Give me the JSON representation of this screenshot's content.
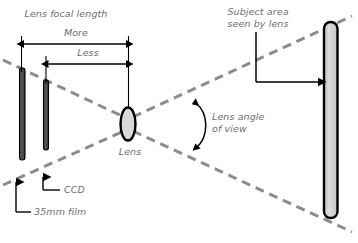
{
  "diagram": {
    "type": "optics-schematic",
    "title": "Lens focal length",
    "background_color": "#ffffff",
    "label_color": "#6d6d6d",
    "ray_color": "#8c8c8c",
    "sensor_fill": "#4a4a4a",
    "subject_fill": "#cfcfcf",
    "lens_fill": "#d9d9d9",
    "outline_color": "#000000"
  },
  "labels": {
    "title": "Lens focal length",
    "more": "More",
    "less": "Less",
    "lens": "Lens",
    "ccd": "CCD",
    "film": "35mm film",
    "subject_area_line1": "Subject area",
    "subject_area_line2": "seen by lens",
    "angle_line1": "Lens angle",
    "angle_line2": "of view"
  },
  "elements": {
    "film_plane": {
      "name": "35mm film",
      "x": 22,
      "top": 68,
      "bottom": 160
    },
    "ccd_plane": {
      "name": "CCD",
      "x": 46,
      "top": 80,
      "bottom": 150
    },
    "lens": {
      "name": "Lens",
      "cx": 128,
      "cy": 124,
      "rx": 7,
      "ry": 16
    },
    "subject_plane": {
      "name": "Subject area seen by lens",
      "x": 331,
      "top": 22,
      "bottom": 218
    }
  },
  "measures": [
    {
      "label": "More",
      "from_x": 21,
      "to_x": 128,
      "y": 44
    },
    {
      "label": "Less",
      "from_x": 46,
      "to_x": 128,
      "y": 64
    }
  ]
}
